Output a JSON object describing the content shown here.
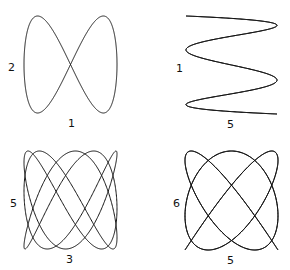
{
  "chart_data": {
    "type": "diagram",
    "title": "",
    "stroke_color": "#111111",
    "figures": [
      {
        "name": "lissajous-1-2",
        "x_freq": 1,
        "y_freq": 2,
        "x_label": "1",
        "y_label": "2",
        "box": [
          24,
          16,
          117,
          113
        ],
        "phase": 1.5707963,
        "label_x_pos": [
          68,
          118
        ],
        "label_y_pos": [
          8,
          62
        ]
      },
      {
        "name": "lissajous-5-1",
        "x_freq": 5,
        "y_freq": 1,
        "x_label": "5",
        "y_label": "1",
        "box": [
          186,
          16,
          277,
          114
        ],
        "phase": 1.5707963,
        "label_x_pos": [
          227,
          119
        ],
        "label_y_pos": [
          176,
          63
        ]
      },
      {
        "name": "lissajous-3-5",
        "x_freq": 3,
        "y_freq": 5,
        "x_label": "3",
        "y_label": "5",
        "box": [
          24,
          151,
          117,
          249
        ],
        "phase": 0.5235988,
        "label_x_pos": [
          66,
          254
        ],
        "label_y_pos": [
          10,
          198
        ]
      },
      {
        "name": "lissajous-5-6",
        "x_freq": 5,
        "y_freq": 6,
        "x_label": "5",
        "y_label": "6",
        "box": [
          185,
          151,
          278,
          250
        ],
        "phase": 0.2617994,
        "label_x_pos": [
          227,
          255
        ],
        "label_y_pos": [
          173,
          198
        ]
      }
    ]
  }
}
